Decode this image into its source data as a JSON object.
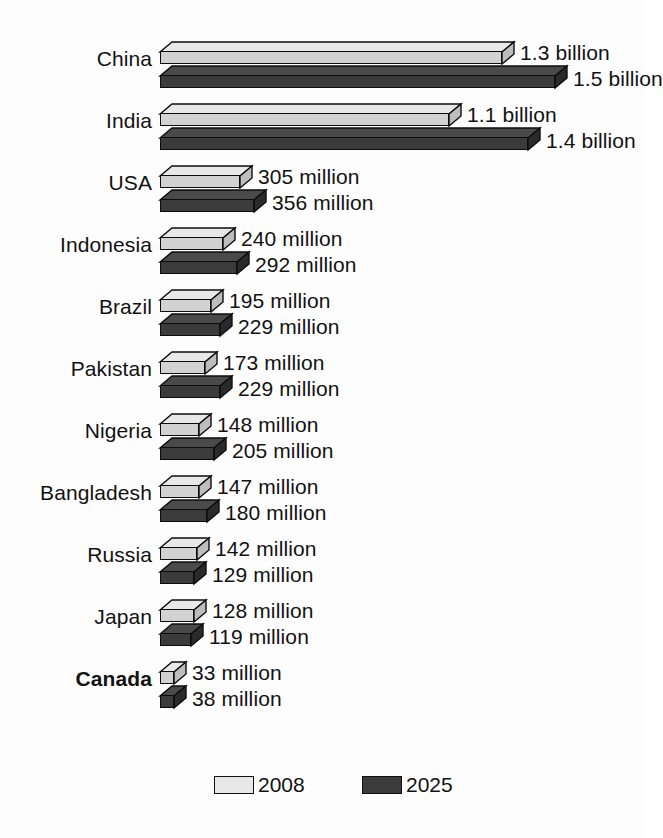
{
  "chart_data": {
    "type": "bar",
    "title": "",
    "subtitle": "",
    "xlabel": "",
    "ylabel": "",
    "orientation": "horizontal",
    "style": "3d-extruded-horizontal-bars",
    "grid": false,
    "legend_position": "bottom-center",
    "axis_visible": false,
    "value_unit": "people",
    "categories": [
      "China",
      "India",
      "USA",
      "Indonesia",
      "Brazil",
      "Pakistan",
      "Nigeria",
      "Bangladesh",
      "Russia",
      "Japan",
      "Canada"
    ],
    "highlighted_category": "Canada",
    "series": [
      {
        "name": "2008",
        "color": "#e8e8e8",
        "values": [
          1300,
          1100,
          305,
          240,
          195,
          173,
          148,
          147,
          142,
          128,
          33
        ],
        "value_labels": [
          "1.3 billion",
          "1.1 billion",
          "305 million",
          "240 million",
          "195 million",
          "173 million",
          "148 million",
          "147 million",
          "142 million",
          "128 million",
          "33 million"
        ]
      },
      {
        "name": "2025",
        "color": "#3b3b3b",
        "values": [
          1500,
          1400,
          356,
          292,
          229,
          229,
          205,
          180,
          129,
          119,
          38
        ],
        "value_labels": [
          "1.5 billion",
          "1.4 billion",
          "356 million",
          "292 million",
          "229 million",
          "229 million",
          "205 million",
          "180 million",
          "129 million",
          "119 million",
          "38 million"
        ]
      }
    ],
    "values_in_millions": true,
    "xlim": [
      0,
      1500
    ]
  },
  "legend": {
    "items": [
      {
        "label": "2008",
        "color": "#e8e8e8"
      },
      {
        "label": "2025",
        "color": "#3b3b3b"
      }
    ]
  },
  "colors": {
    "background": "#fdfdfd",
    "text": "#121212",
    "outline": "#0d0d0d",
    "light_top": "#e8e8e8",
    "light_front": "#d2d2d2",
    "light_side": "#bdbdbd",
    "dark_top": "#4a4a4a",
    "dark_front": "#3b3b3b",
    "dark_side": "#2a2a2a"
  }
}
